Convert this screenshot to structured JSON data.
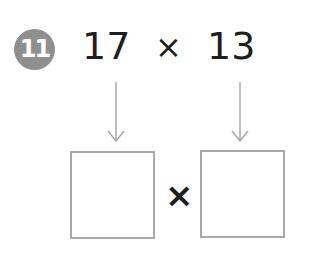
{
  "problem": {
    "number": "11",
    "left_operand": "17",
    "operator": "×",
    "right_operand": "13"
  },
  "answer_row": {
    "left_box_value": "",
    "operator": "×",
    "right_box_value": ""
  },
  "colors": {
    "badge": "#8f8f8f",
    "text": "#1e1e1e",
    "box_border": "#a8a8a8",
    "arrow": "#a8a8a8"
  }
}
